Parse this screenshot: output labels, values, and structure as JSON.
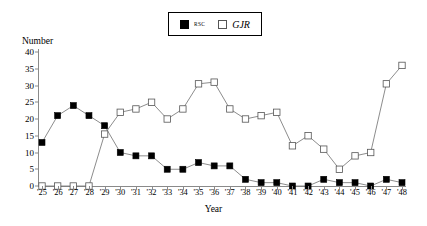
{
  "axes": {
    "y_title": "Number",
    "x_title": "Year",
    "y_ticks": [
      "0",
      "5",
      "10",
      "15",
      "20",
      "25",
      "30",
      "35",
      "40"
    ],
    "x_ticks": [
      "'25",
      "'26",
      "'27",
      "'28",
      "'29",
      "'30",
      "'31",
      "'32",
      "'33",
      "'34",
      "'35",
      "'36",
      "'37",
      "'38",
      "'39",
      "'40",
      "'41",
      "'42",
      "'43",
      "'44",
      "'45",
      "'46",
      "'47",
      "'48"
    ]
  },
  "legend": {
    "items": [
      {
        "label": "RSC",
        "marker": "filled-square",
        "color": "#000000"
      },
      {
        "label": "GJR",
        "marker": "open-square",
        "color": "#ffffff"
      }
    ]
  },
  "chart_data": {
    "type": "line",
    "title": "",
    "xlabel": "Year",
    "ylabel": "Number",
    "ylim": [
      0,
      40
    ],
    "ytick_step": 5,
    "grid": false,
    "legend_position": "top-center",
    "categories": [
      "'25",
      "'26",
      "'27",
      "'28",
      "'29",
      "'30",
      "'31",
      "'32",
      "'33",
      "'34",
      "'35",
      "'36",
      "'37",
      "'38",
      "'39",
      "'40",
      "'41",
      "'42",
      "'43",
      "'44",
      "'45",
      "'46",
      "'47",
      "'48"
    ],
    "series": [
      {
        "name": "RSC",
        "marker": "filled-square",
        "color": "#000000",
        "values": [
          13,
          21,
          24,
          21,
          18,
          10,
          9,
          9,
          5,
          5,
          7,
          6,
          6,
          2,
          1,
          1,
          0,
          0,
          2,
          1,
          1,
          0,
          2,
          1
        ]
      },
      {
        "name": "GJR",
        "marker": "open-square",
        "color": "#ffffff",
        "values": [
          0,
          0,
          0,
          0,
          15.5,
          22,
          23,
          25,
          20,
          23,
          30.5,
          31,
          23,
          20,
          21,
          22,
          12,
          15,
          11,
          5,
          9,
          10,
          30.5,
          36
        ]
      }
    ]
  }
}
